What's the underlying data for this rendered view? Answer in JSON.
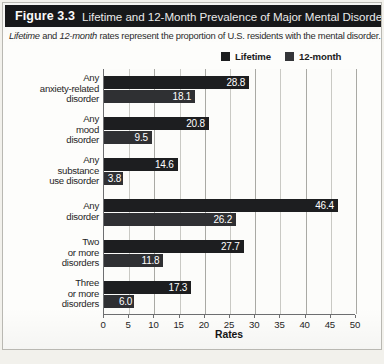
{
  "figure": {
    "number_label": "Figure 3.3",
    "title": "Lifetime and 12-Month Prevalence of Major Mental Disorders.",
    "subtitle_parts": {
      "italic_1": "Lifetime",
      "plain_1": " and ",
      "italic_2": "12-month",
      "plain_2": " rates represent the proportion of U.S. residents with the mental disorder."
    },
    "subtitle_full": "Lifetime and 12-month rates represent the proportion of U.S. residents with the mental disorder.",
    "source_line": ""
  },
  "colors": {
    "header_bar": "#17181a",
    "header_text": "#ffffff",
    "paper": "#fdfdfb",
    "series_lifetime": "#1d1e20",
    "series_twelve_month": "#2f3033",
    "axis": "#6d6e70",
    "gridline": "#c9c9c4",
    "value_label": "#ffffff"
  },
  "legend": {
    "position": "top-right",
    "entries": [
      {
        "label": "Lifetime",
        "swatch": "#1c1d1f",
        "icon": "square-swatch-icon"
      },
      {
        "label": "12-month",
        "swatch": "#343538",
        "icon": "square-swatch-icon"
      }
    ]
  },
  "chart_data": {
    "type": "bar",
    "orientation": "horizontal",
    "title": "Lifetime and 12-Month Prevalence of Major Mental Disorders.",
    "subtitle": "Lifetime and 12-month rates represent the proportion of U.S. residents with the mental disorder.",
    "xlabel": "Rates",
    "ylabel": "",
    "xlim": [
      0,
      50
    ],
    "xticks": [
      0,
      5,
      10,
      15,
      20,
      25,
      30,
      35,
      40,
      45,
      50
    ],
    "grid": true,
    "grid_axis": "x",
    "legend_position": "top-right",
    "categories": [
      "Any anxiety-related disorder",
      "Any mood disorder",
      "Any substance use disorder",
      "Any disorder",
      "Two or more disorders",
      "Three or more disorders"
    ],
    "category_lines": [
      [
        "Any",
        "anxiety-related",
        "disorder"
      ],
      [
        "Any",
        "mood",
        "disorder"
      ],
      [
        "Any",
        "substance",
        "use disorder"
      ],
      [
        "Any",
        "disorder"
      ],
      [
        "Two",
        "or more",
        "disorders"
      ],
      [
        "Three",
        "or more",
        "disorders"
      ]
    ],
    "series": [
      {
        "name": "Lifetime",
        "color": "#1d1e20",
        "values": [
          28.8,
          20.8,
          14.6,
          46.4,
          27.7,
          17.3
        ]
      },
      {
        "name": "12-month",
        "color": "#2f3033",
        "values": [
          18.1,
          9.5,
          3.8,
          26.2,
          11.8,
          6.0
        ]
      }
    ],
    "value_labels": {
      "Lifetime": [
        "28.8",
        "20.8",
        "14.6",
        "46.4",
        "27.7",
        "17.3"
      ],
      "12-month": [
        "18.1",
        "9.5",
        "3.8",
        "26.2",
        "11.8",
        "6.0"
      ]
    }
  }
}
